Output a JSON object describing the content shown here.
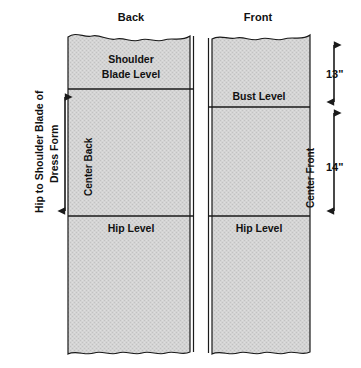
{
  "diagram": {
    "title_back": "Back",
    "title_front": "Front",
    "left_measure_label_line1": "Hip to Shoulder Blade of",
    "left_measure_label_line2": "Dress Form",
    "panels": {
      "back": {
        "name": "Back",
        "center_label": "Center Back",
        "levels": [
          {
            "key": "shoulder-blade-level",
            "label_line1": "Shoulder",
            "label_line2": "Blade Level"
          },
          {
            "key": "hip-level",
            "label": "Hip Level"
          }
        ]
      },
      "front": {
        "name": "Front",
        "center_label": "Center Front",
        "levels": [
          {
            "key": "bust-level",
            "label": "Bust Level"
          },
          {
            "key": "hip-level",
            "label": "Hip Level"
          }
        ]
      }
    },
    "dimensions": [
      {
        "key": "top-to-bust",
        "value": "13\""
      },
      {
        "key": "bust-to-hip",
        "value": "14\""
      }
    ],
    "colors": {
      "fabric_fill": "#d2d2d2",
      "outline": "#1a1a1a",
      "background": "#ffffff",
      "text": "#111111"
    }
  }
}
